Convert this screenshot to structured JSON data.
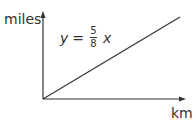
{
  "axes": {
    "y_label": "miles",
    "x_label": "km"
  },
  "equation": {
    "lhs": "y",
    "equals": "=",
    "numerator": "5",
    "denominator": "8",
    "variable": "x"
  },
  "colors": {
    "stroke": "#333333",
    "text": "#333333"
  }
}
